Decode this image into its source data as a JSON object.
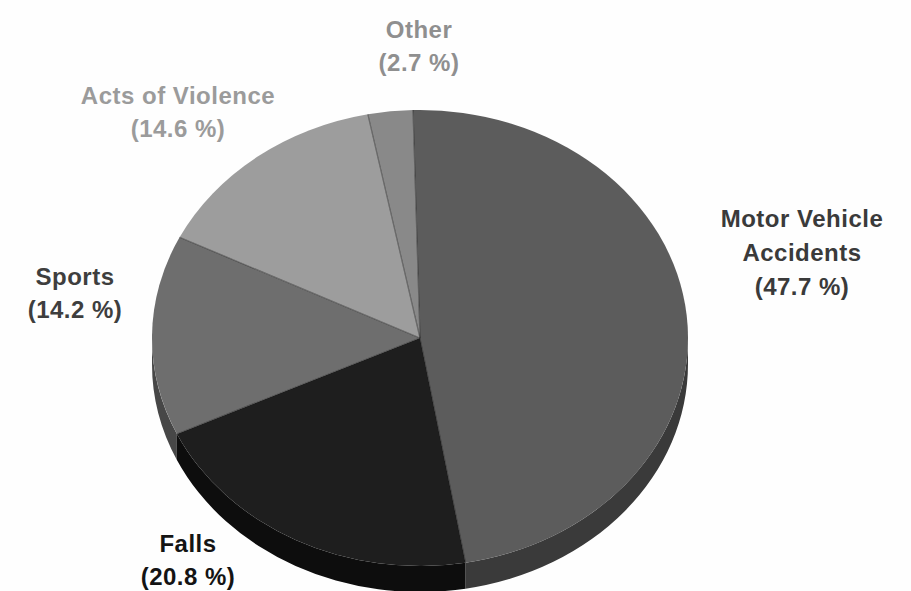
{
  "page": {
    "background": "#fefefe"
  },
  "chart_data": {
    "type": "pie",
    "style": "3d-extruded-grayscale",
    "unit": "%",
    "start_angle_deg": -1.5,
    "direction": "clockwise",
    "legend": "none",
    "slices": [
      {
        "label": "Motor Vehicle Accidents",
        "value": 47.7,
        "color": "#5c5c5c",
        "side_color": "#3a3a3a"
      },
      {
        "label": "Falls",
        "value": 20.8,
        "color": "#1e1e1e",
        "side_color": "#0d0d0d"
      },
      {
        "label": "Sports",
        "value": 14.2,
        "color": "#6e6e6e",
        "side_color": "#474747"
      },
      {
        "label": "Acts of Violence",
        "value": 14.6,
        "color": "#9d9d9d",
        "side_color": "#707070"
      },
      {
        "label": "Other",
        "value": 2.7,
        "color": "#898989",
        "side_color": "#5f5f5f"
      }
    ]
  },
  "labels": {
    "motor_vehicle": {
      "line1": "Motor Vehicle",
      "line2": "Accidents",
      "pct": "(47.7 %)",
      "color": "#3a3a3a"
    },
    "falls": {
      "line1": "Falls",
      "pct": "(20.8 %)",
      "color": "#141414"
    },
    "sports": {
      "line1": "Sports",
      "pct": "(14.2 %)",
      "color": "#3e3e3e"
    },
    "acts_of_violence": {
      "line1": "Acts of Violence",
      "pct": "(14.6 %)",
      "color": "#9b9b9b"
    },
    "other": {
      "line1": "Other",
      "pct": "(2.7 %)",
      "color": "#8f8f8f"
    }
  }
}
